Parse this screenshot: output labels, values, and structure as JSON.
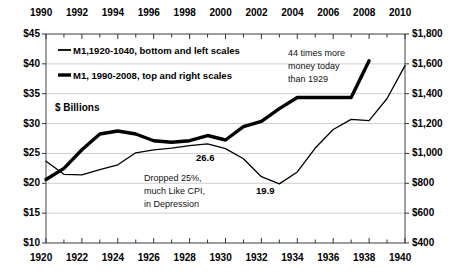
{
  "chart_data": {
    "type": "line",
    "title": "",
    "xlabel": "",
    "ylabel": "$ Billions",
    "units_label": "$ Billions",
    "grid": true,
    "legend_position": "upper-left-inside",
    "bottom_axis": {
      "name": "bottom",
      "ticks": [
        "1920",
        "1922",
        "1924",
        "1926",
        "1928",
        "1930",
        "1932",
        "1934",
        "1936",
        "1938",
        "1940"
      ],
      "range": [
        1920,
        1940
      ],
      "minor_tick_step": 1
    },
    "top_axis": {
      "name": "top",
      "ticks": [
        "1990",
        "1992",
        "1994",
        "1996",
        "1998",
        "2000",
        "2002",
        "2004",
        "2006",
        "2008",
        "2010"
      ],
      "range": [
        1990,
        2010
      ],
      "minor_tick_step": 1
    },
    "left_axis": {
      "name": "left",
      "ticks": [
        "$45",
        "$40",
        "$35",
        "$30",
        "$25",
        "$20",
        "$15",
        "$10"
      ],
      "range": [
        10,
        45
      ],
      "step": 5
    },
    "right_axis": {
      "name": "right",
      "ticks": [
        "$1,800",
        "$1,600",
        "$1,400",
        "$1,200",
        "$1,000",
        "$800",
        "$600",
        "$400"
      ],
      "range": [
        400,
        1800
      ],
      "step": 200
    },
    "series": [
      {
        "name": "M1,1920-1040, bottom and left scales",
        "legend_label": "M1,1920-1040, bottom and left scales",
        "style": "thin",
        "color": "#000000",
        "axes": "bottom-left",
        "x": [
          1920,
          1921,
          1922,
          1923,
          1924,
          1925,
          1926,
          1927,
          1928,
          1929,
          1930,
          1931,
          1932,
          1933,
          1934,
          1935,
          1936,
          1937,
          1938,
          1939,
          1940
        ],
        "values": [
          23.7,
          21.5,
          21.4,
          22.3,
          23.1,
          25.1,
          25.6,
          25.9,
          26.3,
          26.6,
          25.8,
          24.1,
          21.1,
          19.9,
          21.9,
          25.9,
          29.0,
          30.7,
          30.5,
          34.2,
          39.7
        ]
      },
      {
        "name": "M1, 1990-2008, top and right scales",
        "legend_label": "M1, 1990-2008, top and right scales",
        "style": "thick",
        "color": "#000000",
        "axes": "top-right",
        "x": [
          1990,
          1991,
          1992,
          1993,
          1994,
          1995,
          1996,
          1997,
          1998,
          1999,
          2000,
          2001,
          2002,
          2003,
          2004,
          2005,
          2006,
          2007,
          2008
        ],
        "values": [
          825,
          900,
          1025,
          1130,
          1150,
          1130,
          1085,
          1075,
          1085,
          1120,
          1090,
          1180,
          1215,
          1300,
          1375,
          1375,
          1375,
          1375,
          1620
        ]
      }
    ],
    "annotations": [
      {
        "id": "peak-1929",
        "text": "26.6",
        "x": 1929,
        "y": 26.6
      },
      {
        "id": "trough-1933",
        "text": "19.9",
        "x": 1933,
        "y": 19.9
      },
      {
        "id": "depression-note",
        "text_lines": [
          "Dropped 25%,",
          "much Like CPI,",
          "in Depression"
        ]
      },
      {
        "id": "money-note",
        "text_lines": [
          "44 times more",
          "money today",
          "than 1929"
        ]
      }
    ]
  },
  "legend": {
    "entry_1": "M1,1920-1040, bottom and left scales",
    "entry_2": "M1, 1990-2008, top and right scales"
  },
  "annotations": {
    "units": "$ Billions",
    "peak_value": "26.6",
    "trough_value": "19.9",
    "depression_line1": "Dropped 25%,",
    "depression_line2": "much Like CPI,",
    "depression_line3": "in Depression",
    "money_line1": "44 times more",
    "money_line2": "money today",
    "money_line3": "than 1929"
  }
}
